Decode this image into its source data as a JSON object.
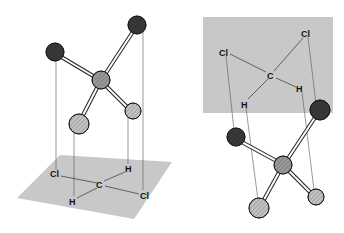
{
  "figure": {
    "left_panel": {
      "labels": {
        "cl1": "Cl",
        "h1": "H",
        "c": "C",
        "h2": "H",
        "cl2": "Cl"
      }
    },
    "right_panel": {
      "labels": {
        "cl1": "Cl",
        "cl2": "Cl",
        "c": "C",
        "h1": "H",
        "h2": "H"
      }
    }
  },
  "colors": {
    "plane": "#c8c8c8",
    "chlorine": "#3a3a3a",
    "carbon": "#9a9a9a",
    "hydrogen": "#c4c4c4"
  }
}
